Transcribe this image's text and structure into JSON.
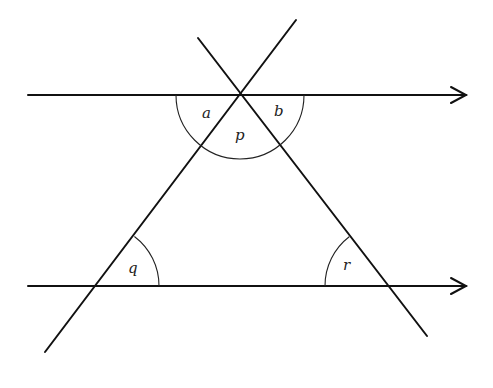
{
  "diagram": {
    "colors": {
      "line": "#111111",
      "background": "#ffffff"
    },
    "labels": {
      "a": "a",
      "b": "b",
      "p": "p",
      "q": "q",
      "r": "r"
    },
    "lines": [
      {
        "name": "top-parallel-line",
        "from": [
          28,
          95
        ],
        "to": [
          467,
          95
        ],
        "arrow": true
      },
      {
        "name": "bottom-parallel-line",
        "from": [
          28,
          286
        ],
        "to": [
          467,
          286
        ],
        "arrow": true
      },
      {
        "name": "left-transversal",
        "from": [
          296,
          20
        ],
        "to": [
          45,
          352
        ]
      },
      {
        "name": "right-transversal",
        "from": [
          198,
          38
        ],
        "to": [
          427,
          336
        ]
      }
    ],
    "angles": [
      {
        "label": "a",
        "vertex": [
          240,
          95
        ],
        "description": "between top line (left) and left transversal"
      },
      {
        "label": "p",
        "vertex": [
          240,
          95
        ],
        "description": "interior angle at apex between transversals"
      },
      {
        "label": "b",
        "vertex": [
          240,
          95
        ],
        "description": "between top line (right) and right transversal"
      },
      {
        "label": "q",
        "vertex": [
          97,
          286
        ],
        "description": "interior angle at bottom-left vertex"
      },
      {
        "label": "r",
        "vertex": [
          387,
          286
        ],
        "description": "interior angle at bottom-right vertex"
      }
    ]
  }
}
